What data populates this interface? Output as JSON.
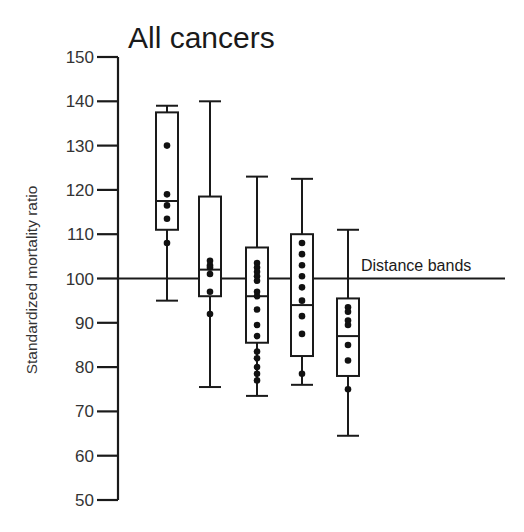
{
  "chart_data": {
    "type": "box",
    "title": "All cancers",
    "xlabel": "",
    "ylabel": "Standardized mortality ratio",
    "ylim": [
      50,
      150
    ],
    "yticks": [
      50,
      60,
      70,
      80,
      90,
      100,
      110,
      120,
      130,
      140,
      150
    ],
    "grid": false,
    "reference_line": {
      "y": 100,
      "label": "Distance bands"
    },
    "series": [
      {
        "name": "Band 1",
        "whisker_high": 139,
        "q3": 137.5,
        "median": 117.5,
        "q1": 111,
        "whisker_low": 95,
        "points": [
          130,
          119,
          116.5,
          113.5,
          108
        ]
      },
      {
        "name": "Band 2",
        "whisker_high": 140,
        "q3": 118.5,
        "median": 102,
        "q1": 96,
        "whisker_low": 75.5,
        "points": [
          104,
          103,
          102.5,
          101,
          97,
          92
        ]
      },
      {
        "name": "Band 3",
        "whisker_high": 123,
        "q3": 107,
        "median": 96,
        "q1": 85.5,
        "whisker_low": 73.5,
        "points": [
          103.5,
          102.5,
          101.5,
          100.5,
          99.5,
          97,
          96,
          93,
          89.5,
          87,
          83.5,
          82,
          80,
          78.5,
          77
        ]
      },
      {
        "name": "Band 4",
        "whisker_high": 122.5,
        "q3": 110,
        "median": 94,
        "q1": 82.5,
        "whisker_low": 76,
        "points": [
          108,
          105.5,
          103,
          100.5,
          98,
          95,
          91.5,
          87.5,
          78.5
        ]
      },
      {
        "name": "Band 5",
        "whisker_high": 111,
        "q3": 95.5,
        "median": 87,
        "q1": 78,
        "whisker_low": 64.5,
        "points": [
          93.5,
          92.5,
          90.5,
          89.5,
          85,
          81.5,
          75
        ]
      }
    ]
  }
}
